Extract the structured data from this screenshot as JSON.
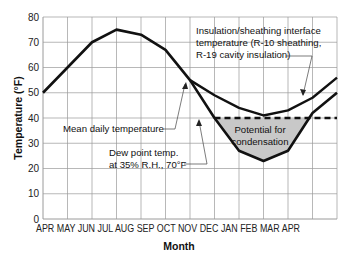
{
  "chart_data": {
    "type": "line",
    "title": "",
    "xlabel": "Month",
    "ylabel": "Temperature (°F)",
    "ylim": [
      0,
      80
    ],
    "yticks": [
      0,
      10,
      20,
      30,
      40,
      50,
      60,
      70,
      80
    ],
    "grid": true,
    "categories": [
      "APR",
      "MAY",
      "JUN",
      "JUL",
      "AUG",
      "SEP",
      "OCT",
      "NOV",
      "DEC",
      "JAN",
      "FEB",
      "MAR",
      "APR"
    ],
    "series": [
      {
        "name": "Mean daily temperature",
        "values": [
          50,
          60,
          70,
          75,
          73,
          67,
          55,
          40,
          27,
          23,
          27,
          42,
          50
        ],
        "style": "solid"
      },
      {
        "name": "Insulation/sheathing interface temperature (R-10 sheathing, R-19 cavity insulation)",
        "values": [
          null,
          null,
          null,
          null,
          null,
          null,
          55,
          49,
          44,
          41,
          43,
          48,
          56
        ],
        "style": "solid"
      },
      {
        "name": "Dew point temp. at 35% R.H., 70°F",
        "values": [
          null,
          null,
          null,
          null,
          null,
          null,
          null,
          40,
          40,
          40,
          40,
          40,
          40
        ],
        "style": "dashed"
      }
    ],
    "annotations": [
      {
        "text": "Potential for condensation",
        "region": "shaded area between dew point line and mean daily temperature, NOV–MAR"
      }
    ]
  },
  "labels": {
    "insulation_line1": "Insulation/sheathing interface",
    "insulation_line2": "temperature (R-10 sheathing,",
    "insulation_line3": "R-19 cavity insulation)",
    "mean_daily": "Mean daily temperature",
    "dew_line1": "Dew point temp.",
    "dew_line2": "at 35% R.H., 70°F",
    "condensation_line1": "Potential for",
    "condensation_line2": "condensation",
    "xaxis_title": "Month",
    "yaxis_title": "Temperature (°F)",
    "xaxis_months": "APR MAY JUN JUL AUG SEP OCT NOV DEC JAN FEB MAR APR"
  },
  "colors": {
    "line": "#111111",
    "grid": "#9a9a9a",
    "shade": "#c8c8c8"
  }
}
